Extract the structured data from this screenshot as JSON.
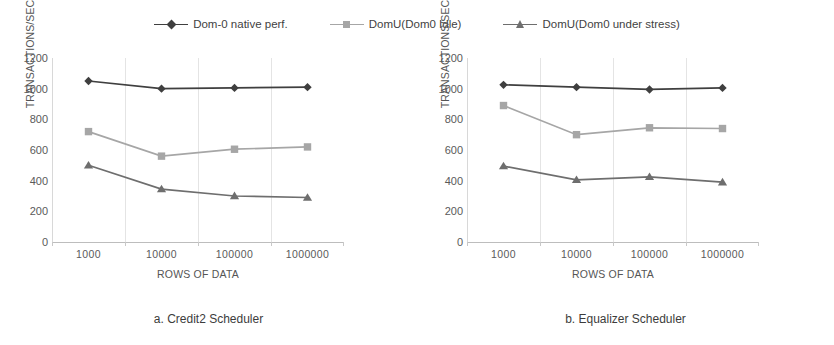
{
  "figure": {
    "background": "#ffffff"
  },
  "legend": {
    "position": "top-center",
    "entries": [
      {
        "label": "Dom-0 native perf.",
        "color": "#3f3f3f",
        "marker": "diamond",
        "icon": "diamond-marker-icon"
      },
      {
        "label": "DomU(Dom0 Idle)",
        "color": "#a6a6a6",
        "marker": "square",
        "icon": "square-marker-icon"
      },
      {
        "label": "DomU(Dom0 under stress)",
        "color": "#6e6e6e",
        "marker": "triangle",
        "icon": "triangle-marker-icon"
      }
    ]
  },
  "panels": [
    {
      "id": "a",
      "caption": "a. Credit2 Scheduler",
      "ylabel": "TRANSACTIONS/SEC",
      "xlabel": "ROWS OF DATA"
    },
    {
      "id": "b",
      "caption": "b. Equalizer Scheduler",
      "ylabel": "TRANSACTIONS/SEC",
      "xlabel": "ROWS OF DATA"
    }
  ],
  "chart_data": [
    {
      "type": "line",
      "title": "a. Credit2 Scheduler",
      "xlabel": "ROWS OF DATA",
      "ylabel": "TRANSACTIONS/SEC",
      "categories": [
        "1000",
        "10000",
        "100000",
        "1000000"
      ],
      "yticks": [
        0,
        200,
        400,
        600,
        800,
        1000,
        1200
      ],
      "ylim": [
        0,
        1200
      ],
      "grid": "vertical",
      "legend": "top-center",
      "series": [
        {
          "name": "Dom-0 native perf.",
          "color": "#3f3f3f",
          "marker": "diamond",
          "values": [
            1050,
            1000,
            1005,
            1010
          ]
        },
        {
          "name": "DomU(Dom0 Idle)",
          "color": "#a6a6a6",
          "marker": "square",
          "values": [
            720,
            560,
            605,
            620
          ]
        },
        {
          "name": "DomU(Dom0 under stress)",
          "color": "#6e6e6e",
          "marker": "triangle",
          "values": [
            500,
            345,
            300,
            290
          ]
        }
      ]
    },
    {
      "type": "line",
      "title": "b. Equalizer Scheduler",
      "xlabel": "ROWS OF DATA",
      "ylabel": "TRANSACTIONS/SEC",
      "categories": [
        "1000",
        "10000",
        "100000",
        "1000000"
      ],
      "yticks": [
        0,
        200,
        400,
        600,
        800,
        1000,
        1200
      ],
      "ylim": [
        0,
        1200
      ],
      "grid": "vertical",
      "legend": "top-center",
      "series": [
        {
          "name": "Dom-0 native perf.",
          "color": "#3f3f3f",
          "marker": "diamond",
          "values": [
            1025,
            1010,
            995,
            1005
          ]
        },
        {
          "name": "DomU(Dom0 Idle)",
          "color": "#a6a6a6",
          "marker": "square",
          "values": [
            890,
            700,
            745,
            740
          ]
        },
        {
          "name": "DomU(Dom0 under stress)",
          "color": "#6e6e6e",
          "marker": "triangle",
          "values": [
            495,
            405,
            425,
            390
          ]
        }
      ]
    }
  ]
}
